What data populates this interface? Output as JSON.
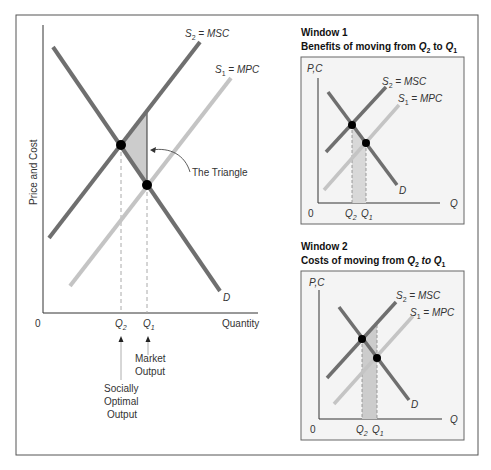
{
  "colors": {
    "msc_line": "#6f6f6f",
    "mpc_line": "#c4c4c4",
    "demand_line": "#6f6f6f",
    "shade": "#cccccc",
    "axis": "#333333",
    "panel_bg": "#f4f4f4",
    "frame": "#555555"
  },
  "main_chart": {
    "y_axis_label": "Price and Cost",
    "x_axis_label": "Quantity",
    "origin": "0",
    "curves": {
      "msc": {
        "s": "S",
        "sub": "2",
        "rest": " = MSC"
      },
      "mpc": {
        "s": "S",
        "sub": "1",
        "rest": " = MPC"
      },
      "demand": "D"
    },
    "q2": {
      "q": "Q",
      "sub": "2"
    },
    "q1": {
      "q": "Q",
      "sub": "1"
    },
    "annotation_triangle": "The Triangle",
    "annotation_market": [
      "Market",
      "Output"
    ],
    "annotation_social": [
      "Socially",
      "Optimal",
      "Output"
    ]
  },
  "window1": {
    "title": "Window 1",
    "subtitle": {
      "pre": "Benefits of moving from ",
      "q2": "Q",
      "s2": "2",
      "mid": " to ",
      "q1": "Q",
      "s1": "1"
    },
    "y_axis_label": "P,C",
    "x_axis_label": "Q",
    "origin": "0",
    "msc": {
      "s": "S",
      "sub": "2",
      "rest": " = MSC"
    },
    "mpc": {
      "s": "S",
      "sub": "1",
      "rest": " = MPC"
    },
    "demand": "D",
    "q2": {
      "q": "Q",
      "sub": "2"
    },
    "q1": {
      "q": "Q",
      "sub": "1"
    }
  },
  "window2": {
    "title": "Window 2",
    "subtitle": {
      "pre": "Costs of moving from ",
      "q2": "Q",
      "s2": "2",
      "mid": " to ",
      "q1": "Q",
      "s1": "1"
    },
    "y_axis_label": "P,C",
    "x_axis_label": "Q",
    "origin": "0",
    "msc": {
      "s": "S",
      "sub": "2",
      "rest": " = MSC"
    },
    "mpc": {
      "s": "S",
      "sub": "1",
      "rest": " = MPC"
    },
    "demand": "D",
    "q2": {
      "q": "Q",
      "sub": "2"
    },
    "q1": {
      "q": "Q",
      "sub": "1"
    }
  }
}
